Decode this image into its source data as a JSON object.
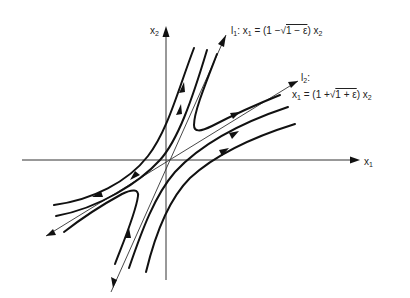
{
  "diagram": {
    "type": "phase-portrait",
    "axes": {
      "x_label": "x",
      "x_sub": "1",
      "y_label": "x",
      "y_sub": "2"
    },
    "lines": {
      "l1": {
        "name": "l",
        "name_sub": "1",
        "equation_prefix": ": x",
        "equation_prefix_sub": "1",
        "equation_mid": " = (1 −",
        "radical": "√",
        "radicand": "1 − ε",
        "equation_end": ") x",
        "equation_end_sub": "2",
        "direction": "inward"
      },
      "l2": {
        "name": "l",
        "name_sub": "2",
        "colon": ":",
        "equation_prefix": "x",
        "equation_prefix_sub": "1",
        "equation_mid": " = (1 +",
        "radical": "√",
        "radicand": "1 + ε",
        "equation_end": ") x",
        "equation_end_sub": "2",
        "direction": "outward"
      }
    },
    "colors": {
      "ink": "#111111",
      "background": "#ffffff"
    }
  }
}
